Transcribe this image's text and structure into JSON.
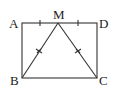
{
  "diagram": {
    "type": "geometry",
    "shape": "rectangle ABCD with segments MB and MC",
    "points": {
      "A": {
        "label": "A",
        "x": 22,
        "y": 23
      },
      "M": {
        "label": "M",
        "x": 58,
        "y": 23
      },
      "D": {
        "label": "D",
        "x": 97,
        "y": 23
      },
      "B": {
        "label": "B",
        "x": 22,
        "y": 78
      },
      "C": {
        "label": "C",
        "x": 97,
        "y": 78
      }
    },
    "segments": [
      {
        "from": "A",
        "to": "D"
      },
      {
        "from": "D",
        "to": "C"
      },
      {
        "from": "C",
        "to": "B"
      },
      {
        "from": "B",
        "to": "A"
      },
      {
        "from": "M",
        "to": "B",
        "mark": "double-tick"
      },
      {
        "from": "M",
        "to": "C",
        "mark": "double-tick"
      }
    ],
    "tick_marks": [
      {
        "segment": "AM",
        "type": "single"
      },
      {
        "segment": "MD",
        "type": "single"
      },
      {
        "segment": "MB",
        "type": "cross"
      },
      {
        "segment": "MC",
        "type": "cross"
      }
    ],
    "colors": {
      "stroke": "#333333",
      "background": "#ffffff"
    }
  }
}
